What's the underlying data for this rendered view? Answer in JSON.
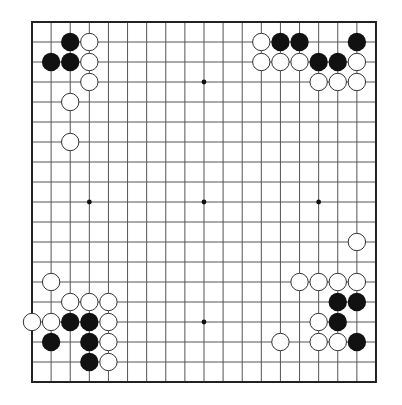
{
  "board": {
    "size": 19,
    "origin_x": 32,
    "origin_y": 22,
    "step_x": 19.11,
    "step_y": 20,
    "line_color": "#555555",
    "border_color": "#222222",
    "black_color": "#111111",
    "white_fill": "#ffffff",
    "white_stroke": "#333333",
    "hoshi": [
      [
        3,
        3
      ],
      [
        9,
        3
      ],
      [
        15,
        3
      ],
      [
        3,
        9
      ],
      [
        9,
        9
      ],
      [
        15,
        9
      ],
      [
        3,
        15
      ],
      [
        9,
        15
      ],
      [
        15,
        15
      ]
    ]
  },
  "stones": {
    "black": [
      [
        2,
        1
      ],
      [
        1,
        2
      ],
      [
        2,
        2
      ],
      [
        13,
        1
      ],
      [
        14,
        1
      ],
      [
        17,
        1
      ],
      [
        15,
        2
      ],
      [
        16,
        2
      ],
      [
        16,
        14
      ],
      [
        17,
        14
      ],
      [
        16,
        15
      ],
      [
        17,
        16
      ],
      [
        2,
        15
      ],
      [
        3,
        15
      ],
      [
        1,
        16
      ],
      [
        3,
        16
      ],
      [
        3,
        17
      ]
    ],
    "white": [
      [
        3,
        1
      ],
      [
        3,
        2
      ],
      [
        3,
        3
      ],
      [
        2,
        4
      ],
      [
        2,
        6
      ],
      [
        12,
        1
      ],
      [
        12,
        2
      ],
      [
        13,
        2
      ],
      [
        14,
        2
      ],
      [
        17,
        2
      ],
      [
        15,
        3
      ],
      [
        16,
        3
      ],
      [
        17,
        3
      ],
      [
        17,
        11
      ],
      [
        14,
        13
      ],
      [
        15,
        13
      ],
      [
        16,
        13
      ],
      [
        17,
        13
      ],
      [
        15,
        15
      ],
      [
        13,
        16
      ],
      [
        15,
        16
      ],
      [
        16,
        16
      ],
      [
        1,
        13
      ],
      [
        2,
        14
      ],
      [
        3,
        14
      ],
      [
        4,
        14
      ],
      [
        0,
        15
      ],
      [
        1,
        15
      ],
      [
        4,
        15
      ],
      [
        4,
        16
      ],
      [
        4,
        17
      ]
    ]
  }
}
